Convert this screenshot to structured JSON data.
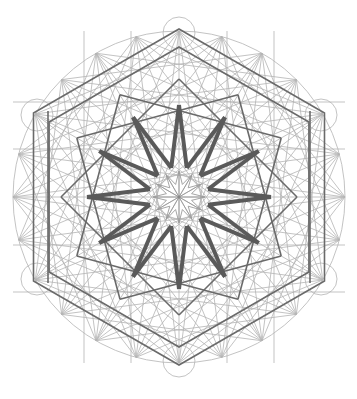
{
  "figure": {
    "title": "Islamic geometric construction: 12-fold star within hexagonal grid",
    "center": [
      179,
      197
    ],
    "outer_circle_radius": 166,
    "vertex_circle_radius": 16,
    "hexagon_vertices": [
      [
        179,
        29
      ],
      [
        324,
        113
      ],
      [
        324,
        281
      ],
      [
        179,
        365
      ],
      [
        34,
        281
      ],
      [
        34,
        113
      ]
    ],
    "star_points": 12,
    "colors": {
      "background": "#ffffff",
      "construction_lines": "#b4b4b4",
      "hexagon_lines": "#6a6a6a",
      "star_lines": "#5a5a5a"
    }
  }
}
